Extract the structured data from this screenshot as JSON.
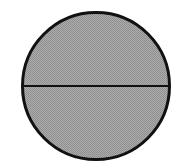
{
  "figure": {
    "kind": "geometry-diagram",
    "title": "Circle with horizontal diameter",
    "background_color": "#FFFFFF",
    "canvas": {
      "width": 182,
      "height": 168
    }
  },
  "chart_data": {
    "type": "diagram",
    "title": "Circle with horizontal diameter",
    "subtitle": "",
    "xlabel": "",
    "ylabel": "",
    "legend": [],
    "annotations": [],
    "grid": false,
    "shapes": [
      {
        "name": "circle",
        "type": "circle",
        "center_x": 96,
        "center_y": 86,
        "radius": 74,
        "fill_color": "#ABABAB",
        "fill_style": "halftone-gray",
        "stroke_color": "#111111",
        "stroke_width": 3
      },
      {
        "name": "diameter-line",
        "type": "line",
        "x1": 22,
        "y1": 86,
        "x2": 170,
        "y2": 86,
        "stroke_color": "#111111",
        "stroke_width": 2
      }
    ],
    "regions": [
      {
        "name": "upper-half-disc",
        "label": "",
        "fill_color": "#ABABAB"
      },
      {
        "name": "lower-half-disc",
        "label": "",
        "fill_color": "#ABABAB"
      }
    ]
  }
}
